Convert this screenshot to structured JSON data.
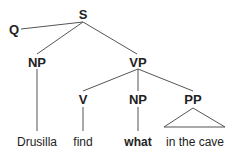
{
  "tree": {
    "nodes": {
      "S": "S",
      "Q": "Q",
      "NP_subject": "NP",
      "VP": "VP",
      "V": "V",
      "NP_object": "NP",
      "PP": "PP"
    },
    "leaves": {
      "subject": "Drusilla",
      "verb": "find",
      "object": "what",
      "pp": "in the cave"
    },
    "line_color": "#555555"
  }
}
